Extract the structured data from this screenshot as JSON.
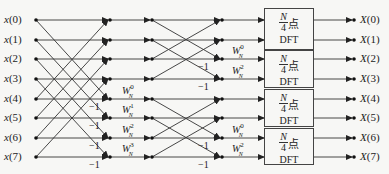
{
  "inputs": [
    "x(0)",
    "x(1)",
    "x(2)",
    "x(3)",
    "x(4)",
    "x(5)",
    "x(6)",
    "x(7)"
  ],
  "outputs": [
    "X(0)",
    "X(1)",
    "X(2)",
    "X(3)",
    "X(4)",
    "X(5)",
    "X(6)",
    "X(7)"
  ],
  "stage1": {
    "twiddles": [
      {
        "base": "W",
        "sup": "0",
        "sub": "N"
      },
      {
        "base": "W",
        "sup": "1",
        "sub": "N"
      },
      {
        "base": "W",
        "sup": "2",
        "sub": "N"
      },
      {
        "base": "W",
        "sup": "3",
        "sub": "N"
      }
    ],
    "neg_labels": [
      "-1",
      "-1",
      "-1",
      "-1"
    ]
  },
  "stage2": {
    "twiddles": [
      {
        "base": "W",
        "sup": "0",
        "sub": "N"
      },
      {
        "base": "W",
        "sup": "2",
        "sub": "N"
      },
      {
        "base": "W",
        "sup": "0",
        "sub": "N"
      },
      {
        "base": "W",
        "sup": "2",
        "sub": "N"
      }
    ],
    "neg_labels": [
      "-1",
      "-1",
      "-1",
      "-1"
    ]
  },
  "dft_blocks": [
    {
      "num": "N",
      "den": "4",
      "suffix": "点",
      "label": "DFT"
    },
    {
      "num": "N",
      "den": "4",
      "suffix": "点",
      "label": "DFT"
    },
    {
      "num": "N",
      "den": "4",
      "suffix": "点",
      "label": "DFT"
    },
    {
      "num": "N",
      "den": "4",
      "suffix": "点",
      "label": "DFT"
    }
  ],
  "colors": {
    "line": "#333333",
    "background": "#f7f7f5"
  }
}
